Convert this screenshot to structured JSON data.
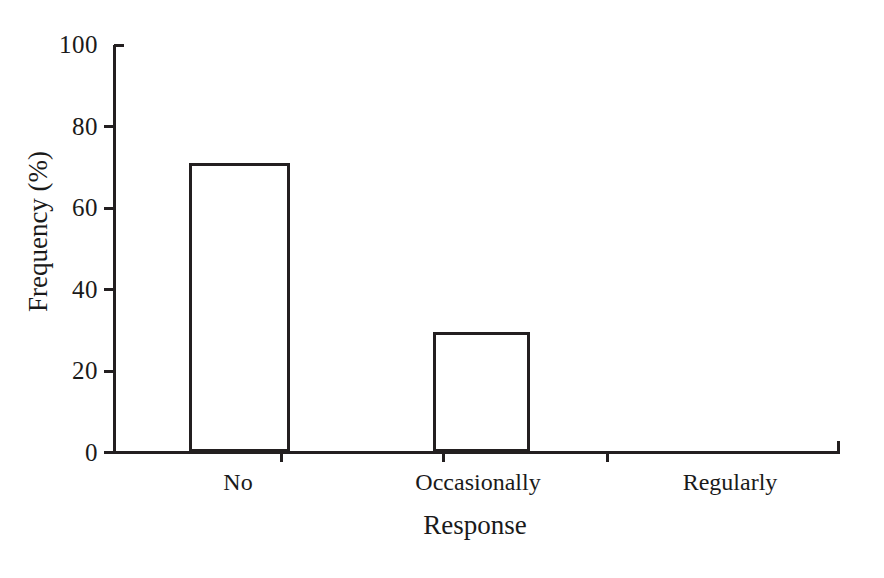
{
  "chart_data": {
    "type": "bar",
    "title": "",
    "subtitle": "",
    "xlabel": "Response",
    "ylabel": "Frequency (%)",
    "categories": [
      "No",
      "Occasionally",
      "Regularly"
    ],
    "values": [
      71,
      29.5,
      0
    ],
    "series": [
      {
        "name": "Frequency",
        "values": [
          71,
          29.5,
          0
        ]
      }
    ],
    "ylim": [
      0,
      100
    ],
    "y_ticks": [
      0,
      20,
      40,
      60,
      80,
      100
    ],
    "y_tick_labels": [
      "0",
      "20",
      "40",
      "60",
      "80",
      "100"
    ],
    "x_tick_labels": [
      "No",
      "Occasionally",
      "Regularly"
    ],
    "grid": false,
    "legend": false,
    "legend_position": "none",
    "annotations": [],
    "bar_style": "hollow-outline",
    "colors": {
      "bar_fill": "#ffffff",
      "bar_edge": "#231f20",
      "axis": "#231f20",
      "text": "#1a1a1a",
      "background": "#ffffff"
    }
  },
  "axes": {
    "y_title": "Frequency (%)",
    "x_title": "Response"
  },
  "y_labels": {
    "t100": "100",
    "t80": "80",
    "t60": "60",
    "t40": "40",
    "t20": "20",
    "t0": "0"
  },
  "x_labels": {
    "c0": "No",
    "c1": "Occasionally",
    "c2": "Regularly"
  }
}
